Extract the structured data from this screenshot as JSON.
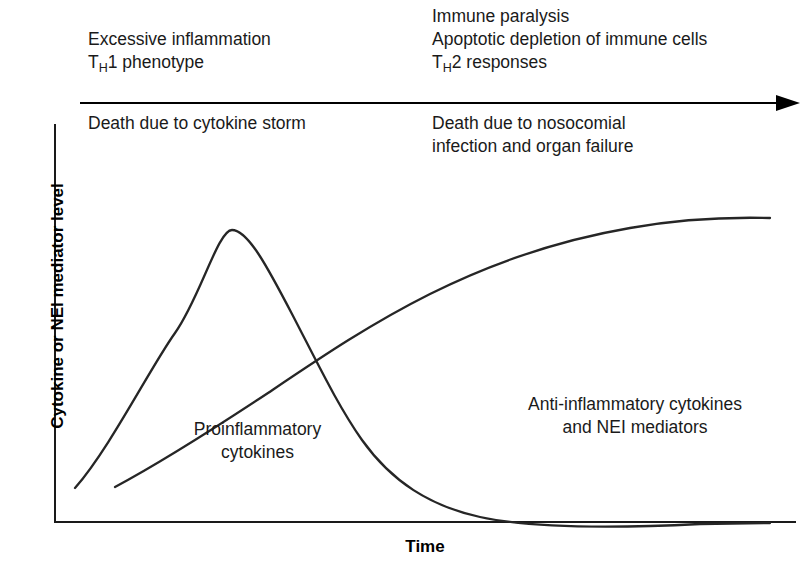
{
  "phases": {
    "early": {
      "top_lines": [
        "Excessive inflammation",
        "T|H|1 phenotype"
      ],
      "outcome_lines": [
        "Death due to cytokine storm"
      ]
    },
    "late": {
      "top_lines": [
        "Immune paralysis",
        "Apoptotic depletion of immune cells",
        "T|H|2 responses"
      ],
      "outcome_lines": [
        "Death due to nosocomial",
        "infection and organ failure"
      ]
    }
  },
  "axes": {
    "y_title": "Cytokine or NEI mediator level",
    "x_title": "Time"
  },
  "curve_labels": {
    "proinflammatory": [
      "Proinflammatory",
      "cytokines"
    ],
    "antiinflammatory": [
      "Anti-inflammatory cytokines",
      "and NEI mediators"
    ]
  },
  "colors": {
    "curve": "#262626",
    "axis": "#1a1a1a",
    "arrow": "#000000",
    "text": "#1a1a1a",
    "background": "#ffffff"
  },
  "chart_data": {
    "type": "line",
    "title": "",
    "xlabel": "Time",
    "ylabel": "Cytokine or NEI mediator level",
    "xlim": [
      0,
      100
    ],
    "ylim": [
      0,
      100
    ],
    "grid": false,
    "legend": "inline-annotations",
    "axis_ticks": {
      "x": [],
      "y": []
    },
    "annotations": [
      {
        "text": "Proinflammatory cytokines",
        "x": 25,
        "y": 40
      },
      {
        "text": "Anti-inflammatory cytokines and NEI mediators",
        "x": 70,
        "y": 53
      }
    ],
    "series": [
      {
        "name": "Proinflammatory cytokines",
        "x": [
          3,
          8,
          14,
          20,
          24,
          30,
          36,
          40,
          46,
          52,
          58,
          64,
          70,
          76,
          82,
          88,
          94,
          98
        ],
        "y": [
          9,
          40,
          69,
          82,
          81,
          73,
          60,
          52,
          40,
          29,
          21,
          15,
          11,
          8,
          7,
          6,
          6,
          6
        ]
      },
      {
        "name": "Anti-inflammatory cytokines and NEI mediators",
        "x": [
          8,
          14,
          20,
          26,
          32,
          38,
          44,
          50,
          56,
          62,
          68,
          74,
          80,
          86,
          92,
          98
        ],
        "y": [
          9,
          17,
          25,
          34,
          42,
          50,
          57,
          63,
          69,
          74,
          78,
          81,
          83,
          85,
          86,
          87
        ]
      }
    ],
    "crossover": {
      "x": 41,
      "y": 49,
      "note": "Curves intersect; proinflammatory declines while anti-inflammatory rises"
    }
  }
}
